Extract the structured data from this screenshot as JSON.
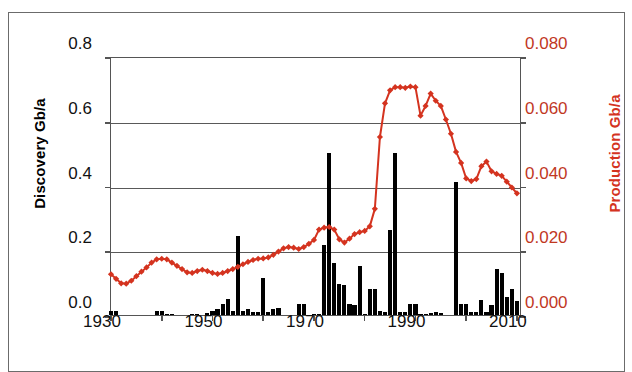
{
  "figure": {
    "left_axis_title": "Discovery Gb/a",
    "right_axis_title": "Production Gb/a",
    "accent_color": "#d4331f",
    "bar_color": "#000000",
    "grid_color": "#595959"
  },
  "axes": {
    "y_left_ticks": [
      "0.0",
      "0.2",
      "0.4",
      "0.6",
      "0.8"
    ],
    "y_right_ticks": [
      "0.000",
      "0.020",
      "0.040",
      "0.060",
      "0.080"
    ],
    "x_ticks": [
      "1930",
      "1950",
      "1970",
      "1990",
      "2010"
    ]
  },
  "chart_data": {
    "type": "bar",
    "title": "",
    "xlabel": "",
    "ylabel": "Discovery Gb/a",
    "y2label": "Production Gb/a",
    "grid": true,
    "legend": "none",
    "xlim": [
      1930,
      2011
    ],
    "ylim": [
      0.0,
      0.8
    ],
    "y2lim": [
      0.0,
      0.08
    ],
    "x_tick_interval": 20,
    "x_minor_tick_interval": 10,
    "series": [
      {
        "name": "Discovery",
        "type": "bar",
        "axis": "left",
        "units": "Gb/a",
        "color": "#000000",
        "x": [
          1930,
          1931,
          1932,
          1933,
          1934,
          1935,
          1936,
          1937,
          1938,
          1939,
          1940,
          1941,
          1942,
          1943,
          1944,
          1945,
          1946,
          1947,
          1948,
          1949,
          1950,
          1951,
          1952,
          1953,
          1954,
          1955,
          1956,
          1957,
          1958,
          1959,
          1960,
          1961,
          1962,
          1963,
          1964,
          1965,
          1966,
          1967,
          1968,
          1969,
          1970,
          1971,
          1972,
          1973,
          1974,
          1975,
          1976,
          1977,
          1978,
          1979,
          1980,
          1981,
          1982,
          1983,
          1984,
          1985,
          1986,
          1987,
          1988,
          1989,
          1990,
          1991,
          1992,
          1993,
          1994,
          1995,
          1996,
          1997,
          1998,
          1999,
          2000,
          2001,
          2002,
          2003,
          2004,
          2005,
          2006,
          2007,
          2008,
          2009,
          2010
        ],
        "values": [
          0.012,
          0.012,
          0.0,
          0.0,
          0.0,
          0.0,
          0.0,
          0.0,
          0.0,
          0.012,
          0.012,
          0.004,
          0.002,
          0.0,
          0.0,
          0.0,
          0.004,
          0.004,
          0.0,
          0.006,
          0.012,
          0.02,
          0.035,
          0.05,
          0.012,
          0.245,
          0.012,
          0.018,
          0.01,
          0.008,
          0.115,
          0.01,
          0.02,
          0.022,
          0.0,
          0.0,
          0.0,
          0.035,
          0.035,
          0.0,
          0.004,
          0.004,
          0.215,
          0.5,
          0.16,
          0.095,
          0.092,
          0.035,
          0.03,
          0.15,
          0.004,
          0.08,
          0.08,
          0.012,
          0.01,
          0.262,
          0.5,
          0.01,
          0.01,
          0.035,
          0.035,
          0.004,
          0.002,
          0.006,
          0.008,
          0.006,
          0.0,
          0.0,
          0.41,
          0.035,
          0.035,
          0.008,
          0.008,
          0.045,
          0.01,
          0.032,
          0.143,
          0.13,
          0.055,
          0.08,
          0.042
        ]
      },
      {
        "name": "Production",
        "type": "line",
        "axis": "right",
        "units": "Gb/a",
        "color": "#d4331f",
        "marker": "diamond",
        "x": [
          1930,
          1931,
          1932,
          1933,
          1934,
          1935,
          1936,
          1937,
          1938,
          1939,
          1940,
          1941,
          1942,
          1943,
          1944,
          1945,
          1946,
          1947,
          1948,
          1949,
          1950,
          1951,
          1952,
          1953,
          1954,
          1955,
          1956,
          1957,
          1958,
          1959,
          1960,
          1961,
          1962,
          1963,
          1964,
          1965,
          1966,
          1967,
          1968,
          1969,
          1970,
          1971,
          1972,
          1973,
          1974,
          1975,
          1976,
          1977,
          1978,
          1979,
          1980,
          1981,
          1982,
          1983,
          1984,
          1985,
          1986,
          1987,
          1988,
          1989,
          1990,
          1991,
          1992,
          1993,
          1994,
          1995,
          1996,
          1997,
          1998,
          1999,
          2000,
          2001,
          2002,
          2003,
          2004,
          2005,
          2006,
          2007,
          2008,
          2009,
          2010
        ],
        "values": [
          0.0132,
          0.0118,
          0.0104,
          0.0103,
          0.0112,
          0.0126,
          0.014,
          0.0153,
          0.0168,
          0.0178,
          0.018,
          0.0178,
          0.0168,
          0.0158,
          0.0148,
          0.0138,
          0.0136,
          0.0142,
          0.0146,
          0.0142,
          0.0136,
          0.0133,
          0.0136,
          0.0142,
          0.0148,
          0.0155,
          0.0163,
          0.017,
          0.0176,
          0.018,
          0.0181,
          0.0184,
          0.0192,
          0.0202,
          0.0212,
          0.0216,
          0.0214,
          0.021,
          0.0216,
          0.0226,
          0.0238,
          0.027,
          0.0276,
          0.0278,
          0.027,
          0.024,
          0.023,
          0.0242,
          0.0256,
          0.0262,
          0.0266,
          0.028,
          0.0334,
          0.0556,
          0.066,
          0.07,
          0.071,
          0.071,
          0.0708,
          0.0712,
          0.071,
          0.0622,
          0.0652,
          0.069,
          0.0668,
          0.0652,
          0.061,
          0.0566,
          0.051,
          0.0476,
          0.0428,
          0.042,
          0.0426,
          0.0466,
          0.048,
          0.045,
          0.0442,
          0.0436,
          0.0418,
          0.04,
          0.0382
        ]
      }
    ]
  }
}
